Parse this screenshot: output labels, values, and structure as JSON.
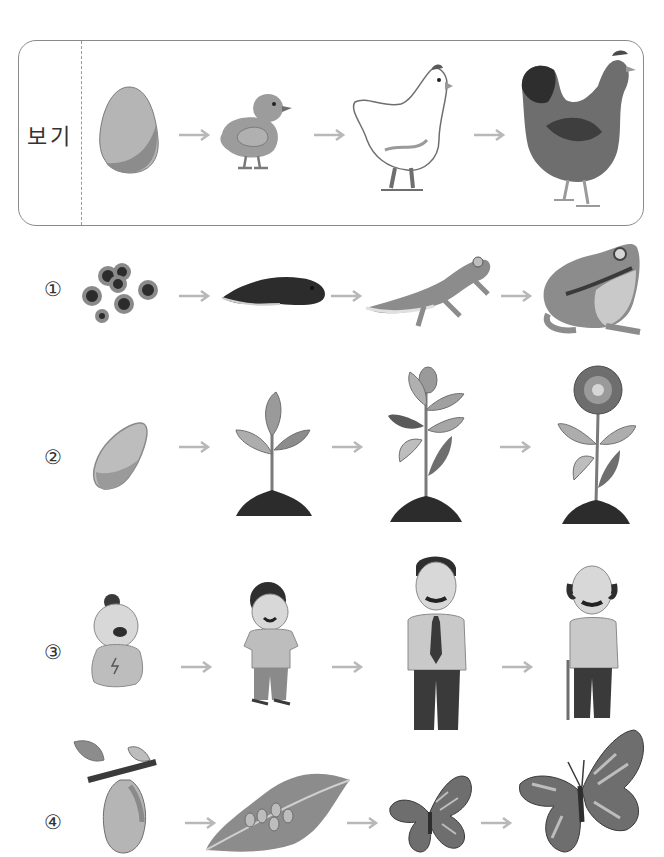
{
  "example": {
    "label": "보기",
    "stages": [
      "egg-icon",
      "chick-icon",
      "young-chicken-icon",
      "hen-icon"
    ]
  },
  "options": [
    {
      "number": "①",
      "stages": [
        "frog-eggs-icon",
        "tadpole-icon",
        "froglet-icon",
        "frog-icon"
      ]
    },
    {
      "number": "②",
      "stages": [
        "seed-icon",
        "sprout-icon",
        "budding-plant-icon",
        "flowering-plant-icon"
      ]
    },
    {
      "number": "③",
      "stages": [
        "baby-icon",
        "child-icon",
        "adult-man-icon",
        "elderly-man-icon"
      ]
    },
    {
      "number": "④",
      "stages": [
        "pupa-icon",
        "leaf-with-eggs-icon",
        "small-butterfly-icon",
        "butterfly-icon"
      ]
    }
  ],
  "arrow_glyph": "→",
  "colors": {
    "border": "#8a8a8a",
    "arrow": "#b8b8b8",
    "text": "#333333",
    "fill_light": "#c8c8c8",
    "fill_mid": "#9a9a9a",
    "fill_dark": "#4a4a4a"
  }
}
